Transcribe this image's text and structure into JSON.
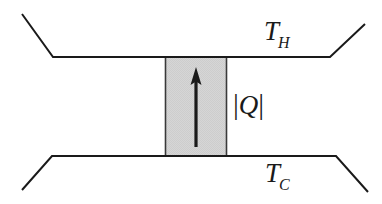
{
  "figure": {
    "background_color": "#ffffff",
    "line_color": "#1a1a1a",
    "block_fill_color": "#d3d3d3",
    "block_border_color": "#3a3a3a"
  },
  "labels": {
    "hot_reservoir": {
      "base": "T",
      "subscript": "H",
      "full": "T_H"
    },
    "cold_reservoir": {
      "base": "T",
      "subscript": "C",
      "full": "T_C"
    },
    "heat": {
      "left_bar": "|",
      "symbol": "Q",
      "right_bar": "|",
      "full": "|Q|"
    }
  },
  "geometry": {
    "top_wall": {
      "points": "22,14 53,57 330,57 365,24",
      "description": "upper reservoir boundary"
    },
    "bottom_wall": {
      "points": "22,190 52,156 336,156 368,192",
      "description": "lower reservoir boundary"
    },
    "block": {
      "x": 165,
      "y": 57,
      "width": 62,
      "height": 99
    },
    "arrow": {
      "x": 196,
      "y_tail": 147,
      "y_head": 68,
      "direction": "up"
    }
  }
}
